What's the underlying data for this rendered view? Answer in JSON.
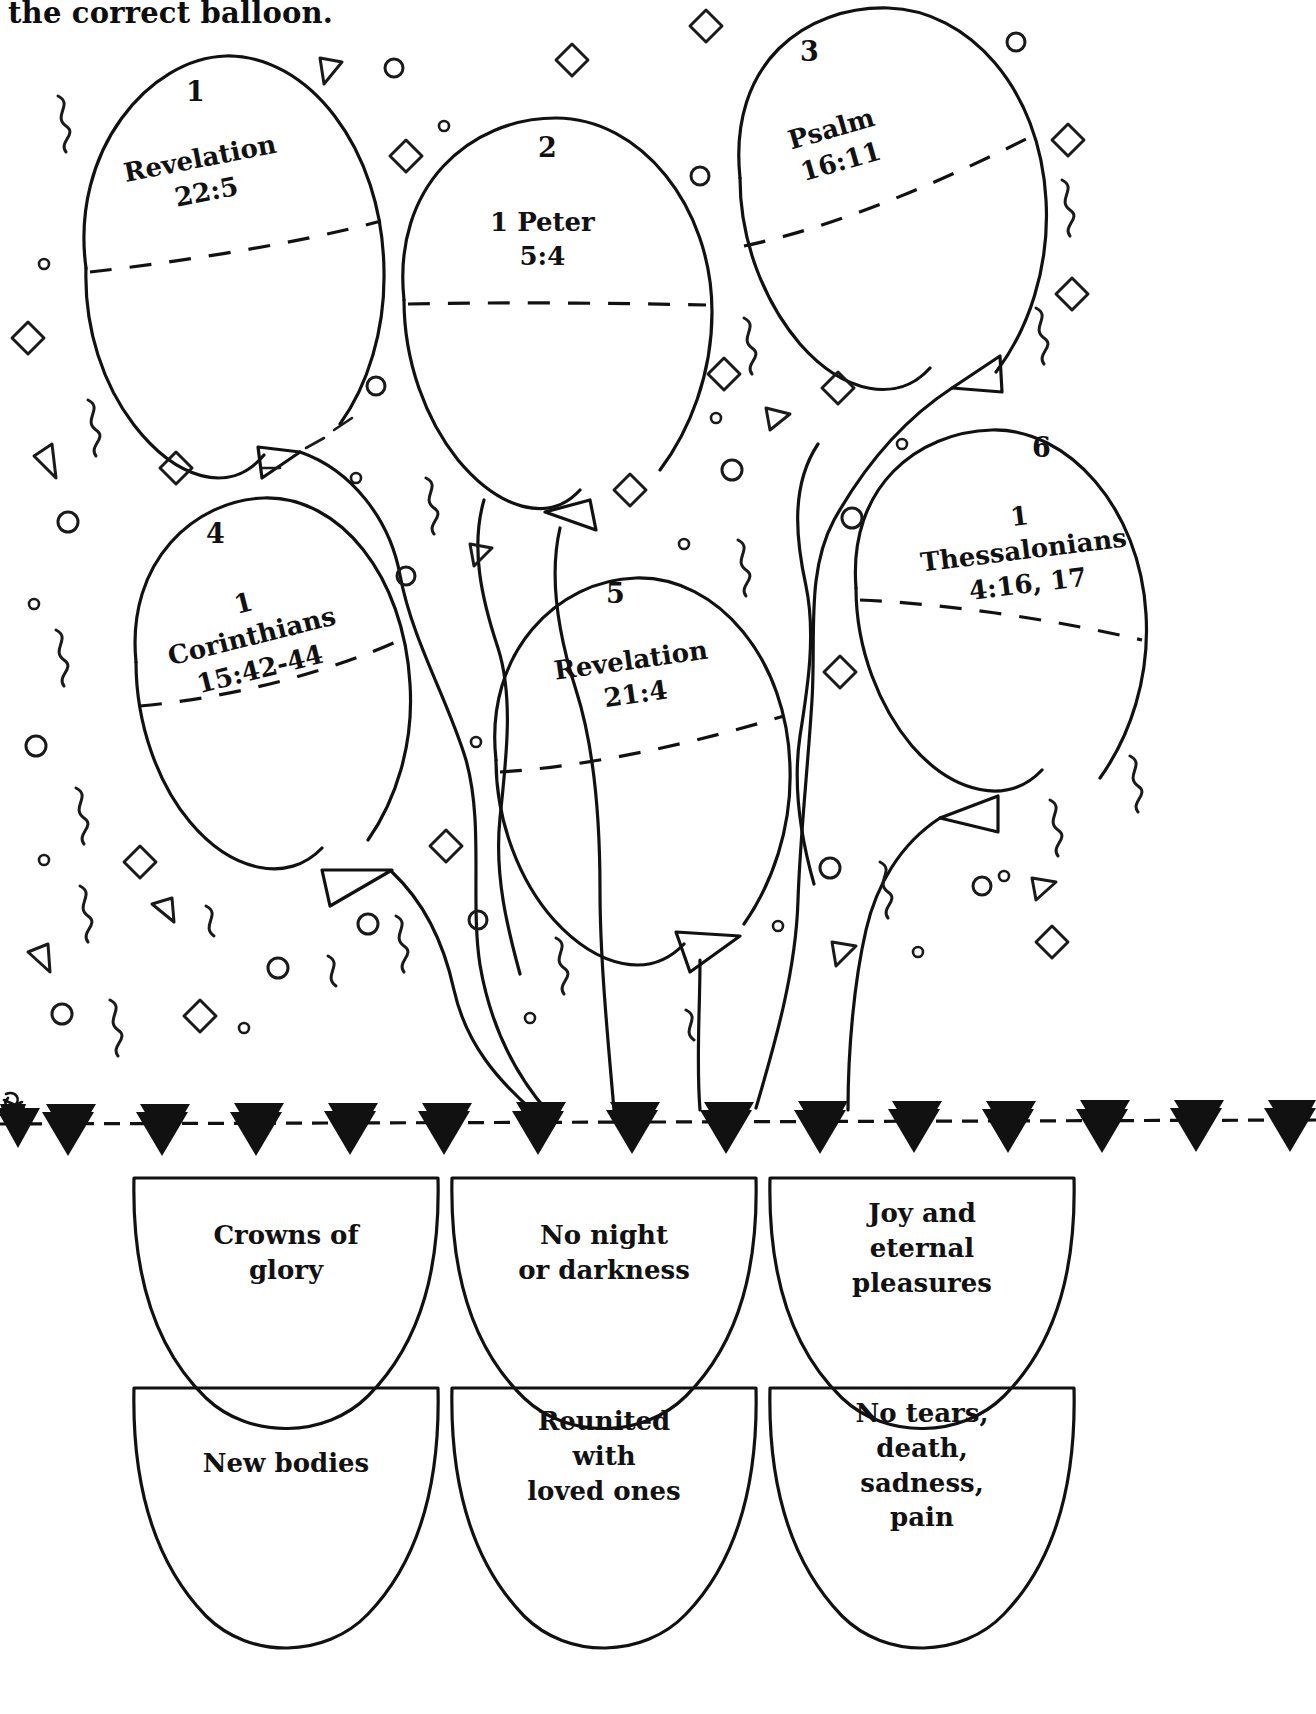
{
  "worksheet": {
    "instruction": "the correct balloon.",
    "ink_color": "#111111",
    "background": "#ffffff"
  },
  "balloons": [
    {
      "number": "1",
      "reference_lines": [
        "Revelation",
        "22:5"
      ],
      "rotation_deg": -11
    },
    {
      "number": "2",
      "reference_lines": [
        "1 Peter",
        "5:4"
      ],
      "rotation_deg": 0
    },
    {
      "number": "3",
      "reference_lines": [
        "Psalm",
        "16:11"
      ],
      "rotation_deg": -16
    },
    {
      "number": "4",
      "reference_lines": [
        "1",
        "Corinthians",
        "15:42-44"
      ],
      "rotation_deg": -14
    },
    {
      "number": "5",
      "reference_lines": [
        "Revelation",
        "21:4"
      ],
      "rotation_deg": -8
    },
    {
      "number": "6",
      "reference_lines": [
        "1",
        "Thessalonians",
        "4:16, 17"
      ],
      "rotation_deg": -7
    }
  ],
  "answer_baskets": [
    {
      "lines": [
        "Crowns of",
        "glory"
      ]
    },
    {
      "lines": [
        "No night",
        "or darkness"
      ]
    },
    {
      "lines": [
        "Joy and",
        "eternal",
        "pleasures"
      ]
    },
    {
      "lines": [
        "New bodies"
      ]
    },
    {
      "lines": [
        "Reunited",
        "with",
        "loved ones"
      ]
    },
    {
      "lines": [
        "No tears,",
        "death,",
        "sadness,",
        "pain"
      ]
    }
  ],
  "decor": {
    "banner_name": "pennant-banner",
    "confetti_shapes": [
      "diamond",
      "circle",
      "triangle",
      "squiggle"
    ]
  }
}
